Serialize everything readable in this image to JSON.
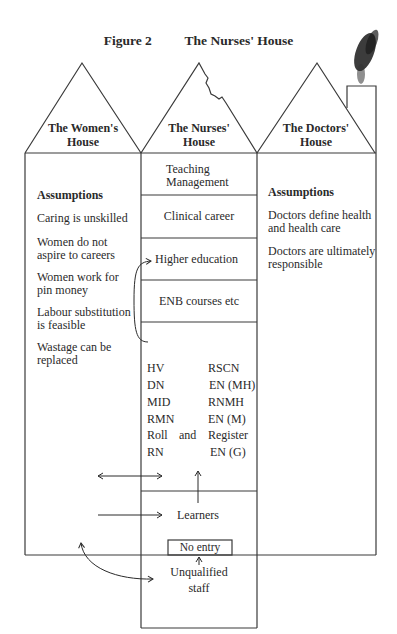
{
  "figure": {
    "label": "Figure 2",
    "title": "The Nurses' House"
  },
  "houses": {
    "women": {
      "roof_label_line1": "The Women's",
      "roof_label_line2": "House",
      "heading": "Assumptions",
      "assumptions": [
        [
          "Caring is unskilled"
        ],
        [
          "Women do not",
          "aspire to careers"
        ],
        [
          "Women work for",
          "pin money"
        ],
        [
          "Labour substitution",
          "is feasible"
        ],
        [
          "Wastage can be",
          "replaced"
        ]
      ]
    },
    "nurses": {
      "roof_label_line1": "The Nurses'",
      "roof_label_line2": "House",
      "floors": [
        {
          "line1": "Teaching",
          "line2": "Management"
        },
        {
          "line1": "Clinical career"
        },
        {
          "line1": "Higher education"
        },
        {
          "line1": "ENB courses etc"
        }
      ],
      "qualifications": [
        [
          "HV",
          "RSCN"
        ],
        [
          "DN",
          "EN (MH)"
        ],
        [
          "MID",
          "RNMH"
        ],
        [
          "RMN",
          "EN (M)"
        ],
        [
          "Roll",
          "and",
          "Register"
        ],
        [
          "RN",
          "EN (G)"
        ]
      ],
      "learners": "Learners",
      "no_entry": "No entry",
      "unqualified_line1": "Unqualified",
      "unqualified_line2": "staff"
    },
    "doctors": {
      "roof_label_line1": "The Doctors'",
      "roof_label_line2": "House",
      "heading": "Assumptions",
      "assumptions": [
        [
          "Doctors define health",
          "and health care"
        ],
        [
          "Doctors are ultimately",
          "responsible"
        ]
      ]
    }
  },
  "colors": {
    "line": "#3a3a3a",
    "text": "#2a2a2a",
    "background": "#ffffff"
  }
}
